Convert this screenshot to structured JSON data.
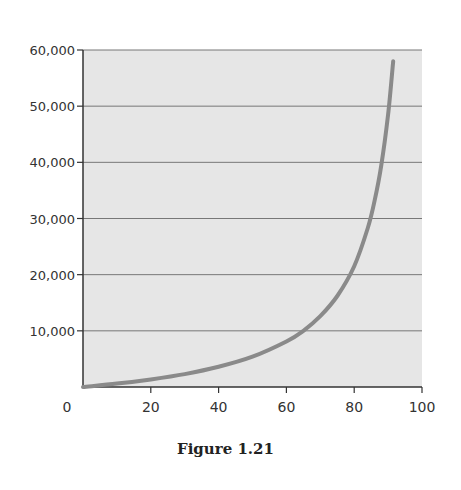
{
  "caption": "Figure 1.21",
  "chart_data": {
    "type": "line",
    "title": "",
    "xlabel": "",
    "ylabel": "",
    "xlim": [
      0,
      100
    ],
    "ylim": [
      0,
      60000
    ],
    "x_ticks": [
      "0",
      "20",
      "40",
      "60",
      "80",
      "100"
    ],
    "y_ticks": [
      "10,000",
      "20,000",
      "30,000",
      "40,000",
      "50,000",
      "60,000"
    ],
    "grid": "horizontal",
    "legend": "none",
    "series": [
      {
        "name": "curve",
        "x": [
          0,
          10,
          20,
          30,
          40,
          50,
          60,
          65,
          70,
          75,
          80,
          84,
          86,
          88,
          90,
          91.5
        ],
        "values": [
          0,
          600,
          1350,
          2300,
          3600,
          5400,
          8100,
          10000,
          12600,
          16200,
          21500,
          28300,
          33100,
          39500,
          48500,
          58000
        ]
      }
    ],
    "colors": {
      "plot_bg": "#e6e6e6",
      "line": "#8a8a8a",
      "grid": "#777777",
      "axis": "#333333"
    }
  }
}
